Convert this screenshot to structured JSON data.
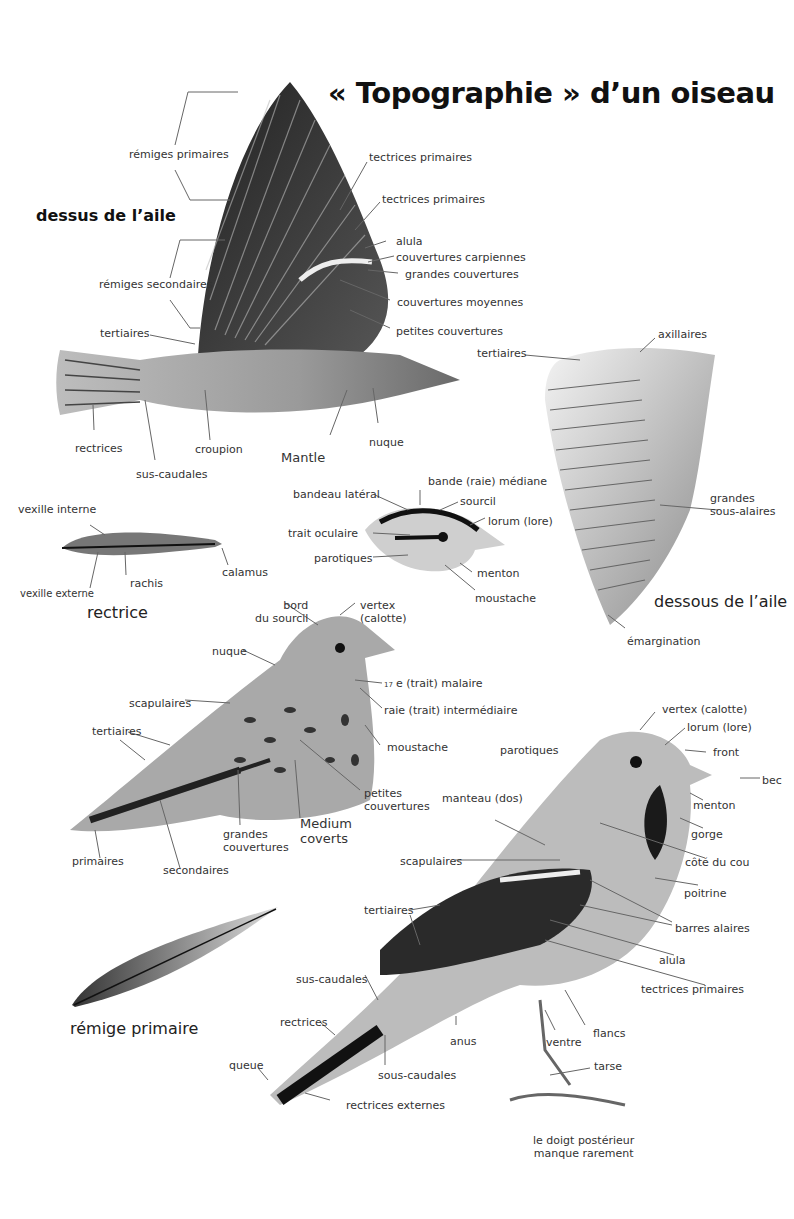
{
  "title": "« Topographie » d’un oiseau",
  "sections": {
    "upperwing": {
      "heading": "dessus de l’aile",
      "labels": [
        "rémiges primaires",
        "rémiges secondaires",
        "tertiaires",
        "tectrices primaires",
        "tectrices primaires",
        "alula",
        "couvertures carpiennes",
        "grandes couvertures",
        "couvertures moyennes",
        "petites couvertures",
        "rectrices",
        "sus-caudales",
        "croupion",
        "Mantle",
        "nuque"
      ]
    },
    "underwing": {
      "heading": "dessous de l’aile",
      "labels": [
        "tertiaires",
        "axillaires",
        "grandes sous-alaires",
        "émargination"
      ]
    },
    "rectrice": {
      "caption": "rectrice",
      "labels": [
        "vexille interne",
        "vexille externe",
        "rachis",
        "calamus"
      ]
    },
    "head": {
      "labels": [
        "bandeau latéral",
        "bande (raie) médiane",
        "sourcil",
        "lorum (lore)",
        "trait oculaire",
        "parotiques",
        "menton",
        "moustache"
      ]
    },
    "perched_bird": {
      "labels": {
        "bord_sourcil": "bord du sourcil",
        "bord_1": "bord",
        "bord_2": "du sourcil",
        "vertex_1": "vertex",
        "vertex_2": "(calotte)",
        "nuque": "nuque",
        "malaire_num": "17",
        "malaire": "e (trait) malaire",
        "intermediaire": "raie (trait) intermédiaire",
        "scapulaires": "scapulaires",
        "moustache": "moustache",
        "tertiaires": "tertiaires",
        "petites_1": "petites",
        "petites_2": "couvertures",
        "medium_1": "Medium",
        "medium_2": "coverts",
        "grandes_1": "grandes",
        "grandes_2": "couvertures",
        "primaires": "primaires",
        "secondaires": "secondaires"
      }
    },
    "remige": {
      "caption": "rémige primaire"
    },
    "standing_bird": {
      "labels": {
        "vertex": "vertex (calotte)",
        "lorum": "lorum (lore)",
        "parotiques": "parotiques",
        "front": "front",
        "bec": "bec",
        "manteau": "manteau (dos)",
        "menton": "menton",
        "gorge": "gorge",
        "scapulaires": "scapulaires",
        "cote_cou": "côté du cou",
        "poitrine": "poitrine",
        "tertiaires": "tertiaires",
        "barres": "barres alaires",
        "alula": "alula",
        "sus_caudales": "sus-caudales",
        "tectrices": "tectrices primaires",
        "rectrices": "rectrices",
        "anus": "anus",
        "ventre": "ventre",
        "flancs": "flancs",
        "queue": "queue",
        "sous_caudales": "sous-caudales",
        "tarse": "tarse",
        "rectrices_ext": "rectrices externes",
        "doigt_1": "le doigt postérieur",
        "doigt_2": "manque rarement"
      }
    }
  }
}
